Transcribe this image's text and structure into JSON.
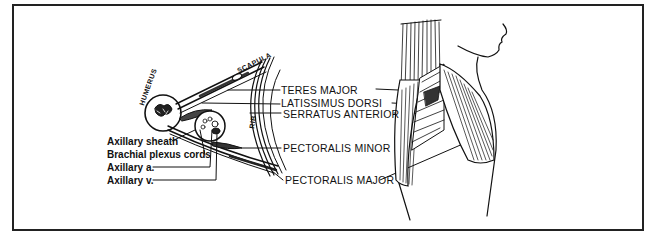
{
  "figure": {
    "cross_section": {
      "bones": [
        {
          "id": "humerus",
          "label": "HUMERUS"
        },
        {
          "id": "scapula",
          "label": "SCAPULA"
        },
        {
          "id": "rib",
          "label": "RIB"
        }
      ],
      "left_labels": [
        {
          "id": "axillary-sheath",
          "label": "Axillary sheath"
        },
        {
          "id": "brachial-plexus-cords",
          "label": "Brachial plexus cords"
        },
        {
          "id": "axillary-artery",
          "label": "Axillary a."
        },
        {
          "id": "axillary-vein",
          "label": "Axillary v."
        }
      ]
    },
    "muscle_labels": [
      {
        "id": "teres-major",
        "label": "TERES MAJOR"
      },
      {
        "id": "latissimus-dorsi",
        "label": "LATISSIMUS DORSI"
      },
      {
        "id": "serratus-anterior",
        "label": "SERRATUS ANTERIOR"
      },
      {
        "id": "pectoralis-minor",
        "label": "PECTORALIS MINOR"
      },
      {
        "id": "pectoralis-major",
        "label": "PECTORALIS MAJOR"
      }
    ],
    "colors": {
      "ink": "#111111",
      "background": "#ffffff",
      "frame": "#222222"
    }
  }
}
